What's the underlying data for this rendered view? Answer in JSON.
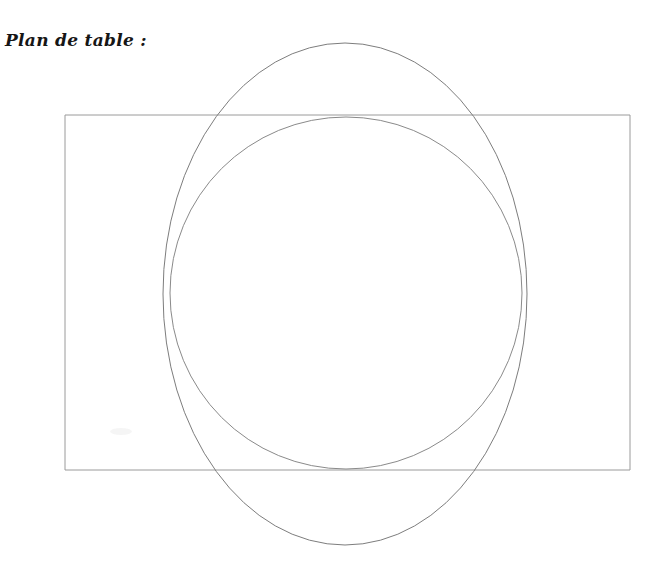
{
  "document": {
    "title": "Plan de table :",
    "background_color": "#ffffff",
    "width": 661,
    "height": 567
  },
  "heading": {
    "label": "Plan de table :",
    "color": "#161616"
  },
  "diagram": {
    "name": "seating-plan-diagram",
    "stroke_color": "#8a8a8a",
    "stroke_color_dark": "#6e6e6e",
    "stroke_width": 1,
    "shapes": [
      {
        "name": "table-rectangle",
        "type": "rect",
        "x": 65,
        "y": 115,
        "width": 565,
        "height": 355,
        "stroke": "#9a9a9a",
        "fill": "none"
      },
      {
        "name": "table-circle",
        "type": "circle",
        "cx": 346,
        "cy": 293,
        "r": 176,
        "stroke": "#8a8a8a",
        "fill": "none"
      },
      {
        "name": "table-ellipse",
        "type": "ellipse",
        "cx": 345,
        "cy": 294,
        "rx": 182,
        "ry": 251,
        "stroke": "#7d7d7d",
        "fill": "none"
      }
    ]
  }
}
